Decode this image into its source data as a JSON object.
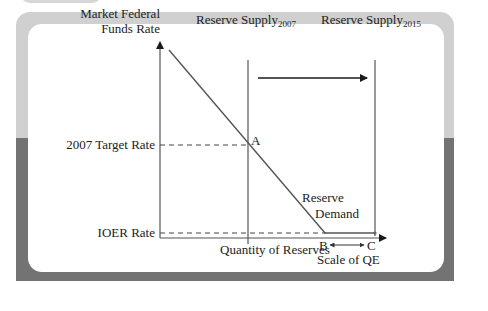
{
  "figure": {
    "y_axis_label_line1": "Market Federal",
    "y_axis_label_line2": "Funds Rate",
    "x_axis_label": "Quantity of Reserves",
    "y_ticks": {
      "target_rate": "2007 Target Rate",
      "ioer_rate": "IOER Rate"
    },
    "supply_2007": {
      "prefix": "Reserve Supply",
      "subscript": "2007"
    },
    "supply_2015": {
      "prefix": "Reserve Supply",
      "subscript": "2015"
    },
    "demand_label_line1": "Reserve",
    "demand_label_line2": "Demand",
    "points": {
      "a": "A",
      "b": "B",
      "c": "C"
    },
    "scale_label": "Scale of QE"
  },
  "colors": {
    "axis": "#1a1a1a",
    "line": "#555555",
    "frame_light": "#d0d0d0",
    "frame_dark": "#737373"
  }
}
